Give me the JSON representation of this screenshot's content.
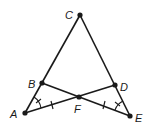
{
  "diagram": {
    "type": "geometry",
    "points": {
      "A": {
        "label": "A",
        "x": 25,
        "y": 113
      },
      "B": {
        "label": "B",
        "x": 42,
        "y": 83
      },
      "C": {
        "label": "C",
        "x": 80,
        "y": 15
      },
      "D": {
        "label": "D",
        "x": 115,
        "y": 85
      },
      "E": {
        "label": "E",
        "x": 130,
        "y": 116
      },
      "F": {
        "label": "F",
        "x": 79,
        "y": 97
      }
    },
    "segments": [
      "AC",
      "CE",
      "BE",
      "DA"
    ],
    "markings": {
      "congruent_segments": [
        "AF",
        "EF"
      ],
      "congruent_angles": [
        "BAF",
        "DEF"
      ]
    },
    "colors": {
      "stroke": "#1a1a1a",
      "background": "#ffffff"
    }
  }
}
